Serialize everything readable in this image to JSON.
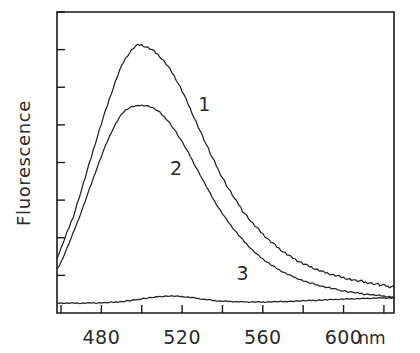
{
  "figure": {
    "title": "",
    "ylabel": "Fluorescence",
    "xunit": "nm"
  },
  "chart_data": {
    "type": "line",
    "title": "",
    "subtitle": "",
    "xlabel": "nm",
    "ylabel": "Fluorescence",
    "xlim": [
      458,
      625
    ],
    "ylim": [
      0,
      100
    ],
    "xticks": [
      460,
      480,
      500,
      520,
      540,
      560,
      580,
      600,
      620
    ],
    "xticklabels": [
      "",
      "480",
      "",
      "520",
      "",
      "560",
      "",
      "600",
      ""
    ],
    "yticks_count": 8,
    "ytick_labels_shown": false,
    "grid": false,
    "legend": "inline-numbered-labels",
    "legend_position": "inside-plot",
    "annotations": [
      {
        "text": "1",
        "x": 531,
        "y": 67,
        "label_for": "1"
      },
      {
        "text": "2",
        "x": 517,
        "y": 46,
        "label_for": "2"
      },
      {
        "text": "3",
        "x": 550,
        "y": 11,
        "label_for": "3"
      }
    ],
    "x": [
      458,
      462,
      466,
      470,
      474,
      478,
      482,
      486,
      490,
      494,
      498,
      502,
      506,
      510,
      514,
      518,
      522,
      526,
      530,
      534,
      538,
      542,
      546,
      550,
      554,
      558,
      562,
      566,
      570,
      574,
      578,
      582,
      586,
      590,
      594,
      598,
      602,
      606,
      610,
      614,
      618,
      622,
      625
    ],
    "series": [
      {
        "name": "1",
        "label": "1",
        "color": "#242424",
        "peak_nm": 498,
        "peak_value": 89,
        "values": [
          18.5,
          25.0,
          32.0,
          40.5,
          49.5,
          58.5,
          67.0,
          75.0,
          82.0,
          86.5,
          89.0,
          88.5,
          87.0,
          84.5,
          81.0,
          76.5,
          71.0,
          65.0,
          59.0,
          53.0,
          47.5,
          42.5,
          38.0,
          34.0,
          30.5,
          27.5,
          24.8,
          22.5,
          20.4,
          18.6,
          17.1,
          15.8,
          14.7,
          13.7,
          12.9,
          12.2,
          11.5,
          10.9,
          10.4,
          9.9,
          9.4,
          8.9,
          8.6
        ]
      },
      {
        "name": "2",
        "label": "2",
        "color": "#242424",
        "peak_nm": 500,
        "peak_value": 69,
        "values": [
          14.5,
          20.0,
          26.5,
          33.5,
          41.0,
          48.5,
          55.5,
          61.5,
          66.0,
          68.3,
          68.9,
          69.0,
          68.0,
          66.0,
          63.0,
          59.0,
          54.5,
          49.5,
          44.5,
          39.5,
          35.0,
          31.0,
          27.5,
          24.3,
          21.5,
          19.0,
          17.0,
          15.2,
          13.7,
          12.4,
          11.3,
          10.3,
          9.5,
          8.8,
          8.2,
          7.6,
          7.1,
          6.7,
          6.3,
          6.0,
          5.7,
          5.4,
          5.2
        ]
      },
      {
        "name": "3",
        "label": "3",
        "color": "#242424",
        "peak_nm": 516,
        "peak_value": 5.6,
        "values": [
          3.3,
          3.3,
          3.3,
          3.3,
          3.4,
          3.4,
          3.5,
          3.6,
          3.8,
          4.1,
          4.5,
          4.9,
          5.2,
          5.5,
          5.6,
          5.5,
          5.3,
          5.0,
          4.6,
          4.3,
          4.0,
          3.9,
          3.8,
          3.7,
          3.7,
          3.7,
          3.7,
          3.8,
          3.8,
          3.9,
          4.0,
          4.1,
          4.2,
          4.3,
          4.4,
          4.5,
          4.6,
          4.7,
          4.8,
          4.9,
          5.0,
          5.0,
          5.0
        ]
      }
    ]
  }
}
